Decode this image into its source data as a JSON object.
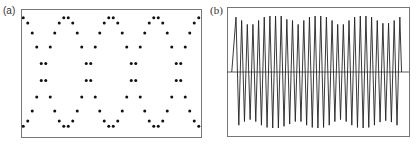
{
  "panels": {
    "a": {
      "label": "(a)"
    },
    "b": {
      "label": "(b)"
    }
  },
  "chart_data": [
    {
      "type": "scatter",
      "panel": "(a)",
      "title": "",
      "xlabel": "",
      "ylabel": "",
      "grid": false,
      "axes_ticks": false,
      "description": "Two sampled sinusoids in anti-phase (y = +cos and y = -cos) drawn as dots, forming a chain of interlocking loops; two full periods visible",
      "series": [
        {
          "name": "curve +cos",
          "function": "y = cos(2*pi*(x - 0.25))",
          "periods_visible": 2
        },
        {
          "name": "curve -cos",
          "function": "y = -cos(2*pi*(x - 0.25))",
          "periods_visible": 2
        }
      ],
      "frame_px": {
        "x0": 21,
        "y0": 9,
        "x1": 201,
        "y1": 137
      },
      "plot_params_px": {
        "center_y": 72,
        "amplitude": 55,
        "period": 90,
        "peak_x": 66,
        "samples_per_period": 20
      },
      "ylim": [
        -1.2,
        1.2
      ]
    },
    {
      "type": "line",
      "panel": "(b)",
      "title": "",
      "xlabel": "",
      "ylabel": "",
      "grid": false,
      "axes_ticks": false,
      "description": "Rapidly oscillating waveform (~30 cycles) with slowly varying amplitude envelope (beating), plus horizontal zero line",
      "frame_px": {
        "x0": 227,
        "y0": 7,
        "x1": 409,
        "y1": 136
      },
      "zero_line_y": 72,
      "cycles": 30,
      "first_peak_x": 236,
      "peak_spacing": 5.65,
      "peak_amplitudes_norm": [
        0.98,
        0.92,
        0.85,
        0.85,
        0.92,
        0.98,
        1.0,
        1.0,
        1.0,
        0.94,
        0.92,
        0.85,
        0.92,
        0.98,
        1.0,
        1.0,
        0.98,
        0.92,
        0.85,
        0.85,
        0.92,
        0.98,
        1.0,
        1.0,
        0.98,
        0.92,
        0.87,
        0.87,
        0.92,
        0.98
      ],
      "amplitude_px": 56,
      "ylim": [
        -1,
        1
      ]
    }
  ]
}
